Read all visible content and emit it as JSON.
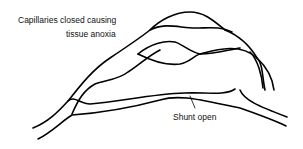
{
  "diagram": {
    "type": "vascular-schematic",
    "labels": {
      "capillaries_line1": "Capillaries closed causing",
      "capillaries_line2": "tissue anoxia",
      "shunt": "Shunt open"
    },
    "colors": {
      "stroke": "#000000",
      "background": "#ffffff",
      "text": "#111111"
    }
  }
}
